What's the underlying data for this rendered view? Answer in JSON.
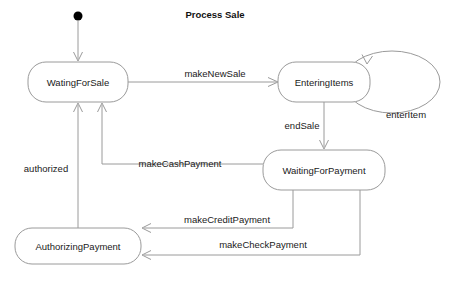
{
  "diagram": {
    "title": "Process Sale",
    "type": "uml-state-machine",
    "background_color": "#ffffff",
    "stroke_color": "#9a9a9a",
    "text_color": "#1a1a1a",
    "initial_state_marker": "filled-circle",
    "states": [
      {
        "id": "waiting_for_sale",
        "label": "WatingForSale",
        "cx": 78,
        "cy": 82,
        "w": 100,
        "h": 40
      },
      {
        "id": "entering_items",
        "label": "EnteringItems",
        "cx": 324,
        "cy": 82,
        "w": 92,
        "h": 40
      },
      {
        "id": "waiting_for_payment",
        "label": "WaitingForPayment",
        "cx": 324,
        "cy": 170,
        "w": 122,
        "h": 40
      },
      {
        "id": "authorizing_payment",
        "label": "AuthorizingPayment",
        "cx": 78,
        "cy": 246,
        "w": 126,
        "h": 36
      }
    ],
    "transitions": [
      {
        "id": "make_new_sale",
        "label": "makeNewSale",
        "from": "waiting_for_sale",
        "to": "entering_items",
        "label_x": 215,
        "label_y": 74
      },
      {
        "id": "enter_item",
        "label": "enterItem",
        "from": "entering_items",
        "to": "entering_items",
        "self_loop": true,
        "label_x": 406,
        "label_y": 115
      },
      {
        "id": "end_sale",
        "label": "endSale",
        "from": "entering_items",
        "to": "waiting_for_payment",
        "label_x": 302,
        "label_y": 126
      },
      {
        "id": "make_cash_payment",
        "label": "makeCashPayment",
        "from": "waiting_for_payment",
        "to": "waiting_for_sale",
        "label_x": 180,
        "label_y": 164
      },
      {
        "id": "make_credit_payment",
        "label": "makeCreditPayment",
        "from": "waiting_for_payment",
        "to": "authorizing_payment",
        "label_x": 227,
        "label_y": 220
      },
      {
        "id": "make_check_payment",
        "label": "makeCheckPayment",
        "from": "waiting_for_payment",
        "to": "authorizing_payment",
        "label_x": 263,
        "label_y": 245
      },
      {
        "id": "authorized",
        "label": "authorized",
        "from": "authorizing_payment",
        "to": "waiting_for_sale",
        "label_x": 46,
        "label_y": 169
      }
    ]
  }
}
